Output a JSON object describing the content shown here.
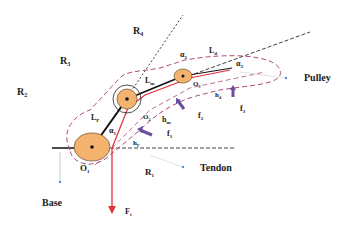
{
  "diagram": {
    "labels": {
      "R4": "R",
      "R4_sub": "4",
      "R3": "R",
      "R3_sub": "3",
      "R2": "R",
      "R2_sub": "2",
      "R1": "R",
      "R1_sub": "1",
      "a2": "α",
      "a2_sub": "2",
      "a3": "α",
      "a3_sub": "3",
      "a1": "α",
      "a1_sub": "1",
      "L4": "L",
      "L4_sub": "d",
      "Lm": "L",
      "Lm_sub": "m",
      "Lp": "L",
      "Lp_sub": "P",
      "O1": "O",
      "O1_sub": "1",
      "O2": "O",
      "O2_sub": "2",
      "O3": "O",
      "O3_sub": "3",
      "hm": "h",
      "hm_sub": "m",
      "hp": "h",
      "hp_sub": "P",
      "hd": "h",
      "hd_sub": "d",
      "f1": "f",
      "f1_sub": "1",
      "f2": "f",
      "f2_sub": "2",
      "f3": "f",
      "f3_sub": "3",
      "F1": "F",
      "F1_sub": "t",
      "pulley": "Pulley",
      "tendon": "Tendon",
      "base": "Base"
    },
    "colors": {
      "joint_fill": "#f4b26f",
      "tendon": "#e0303a",
      "envelope": "#b04a7a",
      "force_arrow": "#6a4fa0",
      "pointer": "#5b8fd6",
      "link": "#111111"
    }
  }
}
